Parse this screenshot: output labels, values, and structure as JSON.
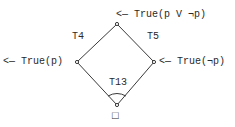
{
  "diagram": {
    "type": "lattice",
    "colors": {
      "line": "#3a3a3a",
      "text": "#2a2a2a",
      "background": "#ffffff"
    },
    "nodes": [
      {
        "id": "top",
        "annotation": "<— True(p V ¬p)"
      },
      {
        "id": "left",
        "annotation": "<— True(p)"
      },
      {
        "id": "right",
        "annotation": "<— True(¬p)"
      },
      {
        "id": "bottom",
        "annotation": "□"
      }
    ],
    "edges": [
      {
        "from": "top",
        "to": "left",
        "label": "T4"
      },
      {
        "from": "top",
        "to": "right",
        "label": "T5"
      },
      {
        "from": "left",
        "to": "bottom"
      },
      {
        "from": "right",
        "to": "bottom"
      }
    ],
    "angle_label": "T13"
  }
}
